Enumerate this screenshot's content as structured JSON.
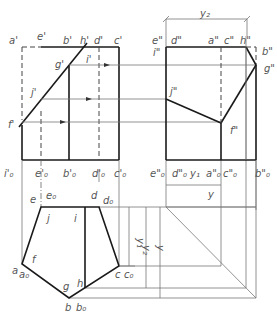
{
  "figure": {
    "type": "orthographic projection of truncated pentagonal prism",
    "views": [
      "front",
      "side",
      "top"
    ]
  },
  "front_view": {
    "labels": {
      "a": "a'",
      "e": "e'",
      "b": "b'",
      "h": "h'",
      "d": "d'",
      "c": "c'",
      "g": "g'",
      "i": "i'",
      "j": "j'",
      "f": "f'",
      "i0": "i'₀",
      "e0": "e'₀",
      "b0": "b'₀",
      "d0": "d'₀",
      "c0": "c'₀"
    }
  },
  "side_view": {
    "labels": {
      "e": "e\"",
      "i": "i\"",
      "d": "d\"",
      "a": "a\"",
      "c": "c\"",
      "h": "h\"",
      "b": "b\"",
      "g": "g\"",
      "j": "j\"",
      "f": "f\"",
      "e0": "e\"₀",
      "d0": "d\"₀",
      "a0": "a\"₀",
      "c0": "c\"₀",
      "b0": "b\"₀"
    },
    "dimension_top": "y₂",
    "dimension_y1": "y₁",
    "dimension_y": "y"
  },
  "top_view": {
    "labels": {
      "e": "e",
      "e0": "e₀",
      "d": "d",
      "d0": "d₀",
      "j": "j",
      "i": "i",
      "f": "f",
      "a": "a",
      "a0": "a₀",
      "c": "c",
      "c0": "c₀",
      "g": "g",
      "h": "h",
      "b": "b",
      "b0": "b₀"
    },
    "dimensions": {
      "y1": "y₁",
      "y2": "y₂",
      "y": "y"
    }
  }
}
